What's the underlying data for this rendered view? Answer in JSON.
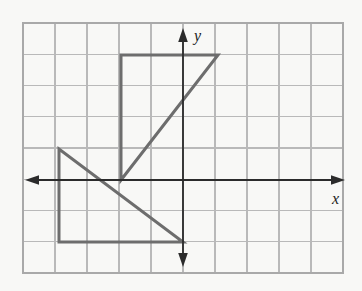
{
  "figure": {
    "kind": "coordinate-grid-transformation-diagram",
    "background_color": "#f8f8f6",
    "grid": {
      "line_color": "#b9b9b9",
      "border_color": "#a9a9a9",
      "columns": 10,
      "rows": 8,
      "cell_width": 32,
      "cell_height": 31.25,
      "left": 23,
      "top": 23,
      "right": 343,
      "bottom": 273,
      "x_range": [
        -5,
        5
      ],
      "y_range": [
        -3,
        5
      ]
    },
    "axes": {
      "color": "#2b2b2b",
      "origin_px": [
        183,
        180
      ],
      "x_axis": {
        "label": "x",
        "label_pos_px": [
          333,
          203
        ],
        "start_px": [
          27,
          180
        ],
        "end_px": [
          345,
          180
        ],
        "arrow_start": true,
        "arrow_end": true
      },
      "y_axis": {
        "label": "y",
        "label_pos_px": [
          194,
          40
        ],
        "start_px": [
          183,
          267
        ],
        "end_px": [
          183,
          30
        ],
        "arrow_start": true,
        "arrow_end": true
      }
    },
    "shapes": [
      {
        "name": "upper-triangle",
        "stroke_color": "#6d6d6d",
        "stroke_width": 3,
        "fill": "none",
        "closed": true,
        "vertices_px": [
          [
            121,
            55
          ],
          [
            218,
            55
          ],
          [
            121,
            180
          ]
        ],
        "vertices_units": [
          [
            -2,
            4
          ],
          [
            1,
            4
          ],
          [
            -2,
            0
          ]
        ]
      },
      {
        "name": "lower-triangle",
        "stroke_color": "#6d6d6d",
        "stroke_width": 3,
        "fill": "none",
        "closed": true,
        "vertices_px": [
          [
            59,
            149
          ],
          [
            59,
            242
          ],
          [
            183,
            242
          ]
        ],
        "vertices_units": [
          [
            -4,
            1
          ],
          [
            -4,
            -2
          ],
          [
            0,
            -2
          ]
        ]
      }
    ]
  },
  "chart_data": {
    "type": "scatter",
    "title": "",
    "xlabel": "x",
    "ylabel": "y",
    "xlim": [
      -5,
      5
    ],
    "ylim": [
      -3,
      5
    ],
    "grid": true,
    "legend": "none",
    "series": [
      {
        "name": "upper-triangle",
        "x": [
          -2,
          1,
          -2,
          -2
        ],
        "y": [
          4,
          4,
          0,
          4
        ]
      },
      {
        "name": "lower-triangle",
        "x": [
          -4,
          -4,
          0,
          -4
        ],
        "y": [
          1,
          -2,
          -2,
          1
        ]
      }
    ],
    "annotations": []
  }
}
